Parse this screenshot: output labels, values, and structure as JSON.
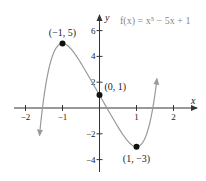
{
  "chart_data": {
    "type": "line",
    "title": "",
    "function_label": "f(x) = x⁵ − 5x + 1",
    "xlabel": "x",
    "ylabel": "y",
    "xlim": [
      -2.2,
      2.5
    ],
    "ylim": [
      -5,
      7
    ],
    "x_ticks": [
      -2,
      -1,
      1,
      2
    ],
    "x_tick_labels": [
      "−2",
      "−1",
      "1",
      "2"
    ],
    "y_ticks": [
      6,
      4,
      2,
      -2,
      -4
    ],
    "y_tick_labels": [
      "6",
      "4",
      "2",
      "−2",
      "−4"
    ],
    "grid": false,
    "series": [
      {
        "name": "f(x) = x^5 - 5x + 1",
        "expression": "x^5 - 5x + 1",
        "x_range": [
          -1.62,
          1.55
        ],
        "color": "#999999"
      }
    ],
    "annotations": [
      {
        "label": "(−1, 5)",
        "x": -1,
        "y": 5
      },
      {
        "label": "(0, 1)",
        "x": 0,
        "y": 1
      },
      {
        "label": "(1, −3)",
        "x": 1,
        "y": -3
      }
    ]
  }
}
